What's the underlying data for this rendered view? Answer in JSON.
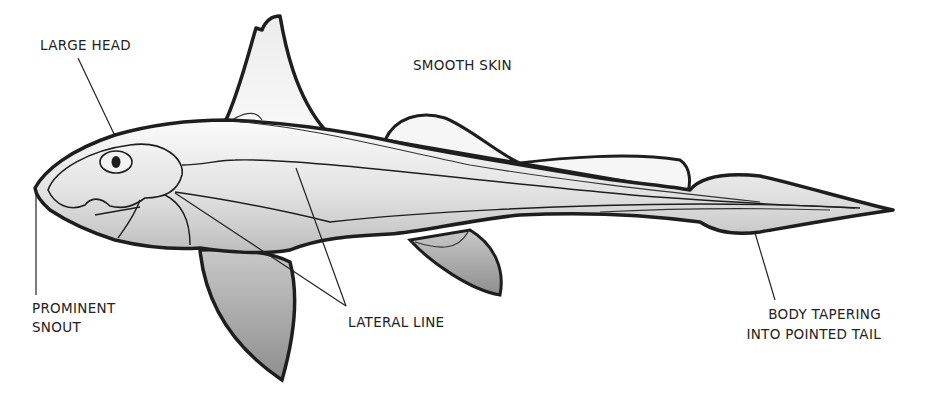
{
  "diagram": {
    "colors": {
      "outline": "#1e1e1e",
      "body_light": "#f4f4f4",
      "body_mid": "#cfcfcf",
      "fin_dark": "#9a9a9a",
      "label_text": "#222222",
      "leader_line": "#222222"
    }
  },
  "labels": {
    "large_head": "LARGE HEAD",
    "smooth_skin": "SMOOTH SKIN",
    "prominent_snout_line1": "PROMINENT",
    "prominent_snout_line2": "SNOUT",
    "lateral_line": "LATERAL LINE",
    "tail_line1": "BODY TAPERING",
    "tail_line2": "INTO POINTED TAIL"
  }
}
